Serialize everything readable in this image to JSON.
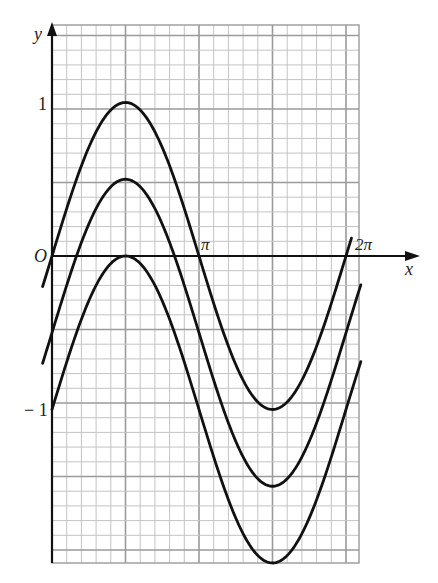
{
  "chart_data": {
    "type": "line",
    "title": "",
    "xlabel": "x",
    "ylabel": "y",
    "origin_label": "O",
    "x_tick_labels": [
      {
        "label": "π",
        "value": 3.14159
      },
      {
        "label": "2π",
        "value": 6.28319
      }
    ],
    "y_tick_labels": [
      {
        "label": "1",
        "value": 1
      },
      {
        "label": "−1",
        "value": -1
      }
    ],
    "xlim": [
      -0.05,
      7.2
    ],
    "ylim": [
      -2.05,
      1.5
    ],
    "grid": true,
    "legend": null,
    "series": [
      {
        "name": "y = sin x",
        "x_range": [
          -0.2,
          6.4
        ],
        "offset": 0,
        "key_points": [
          [
            0,
            0
          ],
          [
            1.5708,
            1
          ],
          [
            3.1416,
            0
          ],
          [
            4.7124,
            -1
          ],
          [
            6.2832,
            0
          ]
        ]
      },
      {
        "name": "y = sin x − 0.5",
        "x_range": [
          -0.2,
          6.6
        ],
        "offset": -0.5,
        "key_points": [
          [
            0,
            -0.5
          ],
          [
            1.5708,
            0.5
          ],
          [
            3.1416,
            -0.5
          ],
          [
            4.7124,
            -1.5
          ],
          [
            6.2832,
            -0.5
          ]
        ]
      },
      {
        "name": "y = sin x − 1",
        "x_range": [
          0,
          6.6
        ],
        "offset": -1,
        "key_points": [
          [
            0,
            -1
          ],
          [
            1.5708,
            0
          ],
          [
            3.1416,
            -1
          ],
          [
            4.7124,
            -2
          ],
          [
            6.2832,
            -1
          ]
        ]
      }
    ]
  },
  "labels": {
    "y_axis": "y",
    "x_axis": "x",
    "origin": "O",
    "pi": "π",
    "two_pi": "2π",
    "one": "1",
    "minus_one": "− 1"
  }
}
